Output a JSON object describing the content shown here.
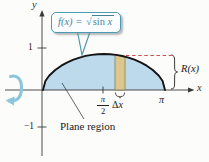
{
  "figure": {
    "callout": {
      "prefix": "f(x) = ",
      "radical_sign": "√",
      "radicand_fn": "sin ",
      "radicand_var": "x"
    },
    "labels": {
      "y_axis": "y",
      "x_axis": "x",
      "one": "1",
      "neg_one": "−1",
      "pi_over_2_num": "π",
      "pi_over_2_den": "2",
      "delta": "Δ",
      "delta_var": "x",
      "pi": "π",
      "radius": "R(x)",
      "plane_region": "Plane region"
    },
    "colors": {
      "region_fill": "#bcdaeb",
      "strip_fill": "#dcc88f",
      "strip_stroke": "#8b7d52",
      "dash_red": "#cc5050",
      "curve": "#141414",
      "axis": "#3a3a3a",
      "rotation_arrow": "#8cc5dd",
      "callout_teal": "#4e9ab0"
    }
  }
}
